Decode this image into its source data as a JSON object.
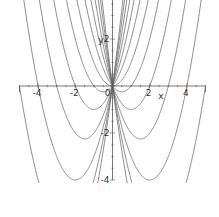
{
  "chart_data": {
    "type": "line",
    "title": "",
    "xlabel": "x",
    "ylabel": "y",
    "xlim": [
      -5,
      5
    ],
    "ylim": [
      -4,
      3.66
    ],
    "grid": false,
    "legend": "none",
    "x_ticks": [
      -4,
      -2,
      2,
      4
    ],
    "x_tick_labels": [
      "-4",
      "-2",
      "2",
      "4"
    ],
    "y_ticks": [
      2,
      -2,
      -4
    ],
    "y_tick_labels": [
      "2",
      "-2",
      "-4"
    ],
    "origin_label": "0",
    "family": "y = x^2 + c*x",
    "series": [
      {
        "name": "c=-6",
        "a": 1,
        "c": -6
      },
      {
        "name": "c=-5",
        "a": 1,
        "c": -5
      },
      {
        "name": "c=-4",
        "a": 1,
        "c": -4
      },
      {
        "name": "c=-3",
        "a": 1,
        "c": -3
      },
      {
        "name": "c=-2",
        "a": 1,
        "c": -2
      },
      {
        "name": "c=-1",
        "a": 1,
        "c": -1
      },
      {
        "name": "c=0",
        "a": 1,
        "c": 0
      },
      {
        "name": "c=1",
        "a": 1,
        "c": 1
      },
      {
        "name": "c=2",
        "a": 1,
        "c": 2
      },
      {
        "name": "c=3",
        "a": 1,
        "c": 3
      },
      {
        "name": "c=4",
        "a": 1,
        "c": 4
      },
      {
        "name": "c=5",
        "a": 1,
        "c": 5
      },
      {
        "name": "c=6",
        "a": 1,
        "c": 6
      }
    ],
    "line_color": "#666666",
    "axis_color": "#555555"
  }
}
